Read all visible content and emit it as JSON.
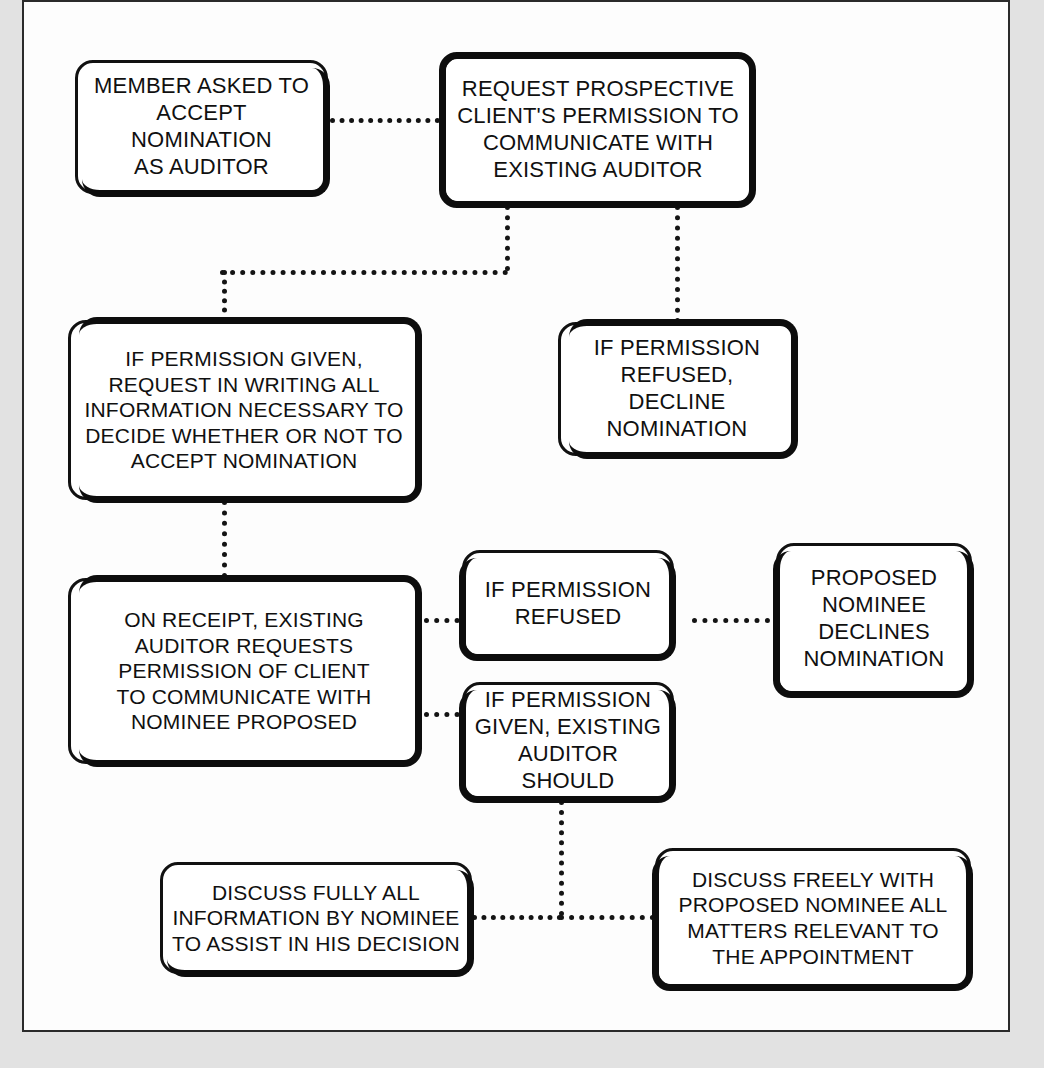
{
  "diagram": {
    "accent_color": "#111111",
    "page_background": "#fdfdfd",
    "connector_style": "dotted",
    "nodes": [
      {
        "id": "member-asked",
        "label": "MEMBER ASKED TO\nACCEPT NOMINATION\nAS AUDITOR"
      },
      {
        "id": "request-permission",
        "label": "REQUEST PROSPECTIVE\nCLIENT'S PERMISSION TO\nCOMMUNICATE WITH\nEXISTING AUDITOR"
      },
      {
        "id": "permission-given-request-writing",
        "label": "IF PERMISSION GIVEN,\nREQUEST IN WRITING  ALL\nINFORMATION NECESSARY TO\nDECIDE WHETHER OR NOT TO\nACCEPT NOMINATION"
      },
      {
        "id": "permission-refused-decline",
        "label": "IF PERMISSION\nREFUSED, DECLINE\nNOMINATION"
      },
      {
        "id": "on-receipt-existing-auditor",
        "label": "ON RECEIPT, EXISTING\nAUDITOR REQUESTS\nPERMISSION OF CLIENT\nTO COMMUNICATE WITH\nNOMINEE PROPOSED"
      },
      {
        "id": "permission-refused",
        "label": "IF PERMISSION\nREFUSED"
      },
      {
        "id": "proposed-nominee-declines",
        "label": "PROPOSED\nNOMINEE\nDECLINES\nNOMINATION"
      },
      {
        "id": "permission-given-existing-auditor",
        "label": "IF PERMISSION\nGIVEN, EXISTING\nAUDITOR SHOULD"
      },
      {
        "id": "discuss-fully-all",
        "label": "DISCUSS FULLY ALL\nINFORMATION BY NOMINEE\nTO ASSIST IN HIS DECISION"
      },
      {
        "id": "discuss-freely-with",
        "label": "DISCUSS FREELY WITH\nPROPOSED NOMINEE ALL\nMATTERS RELEVANT TO\nTHE APPOINTMENT"
      }
    ],
    "edges": [
      {
        "from": "member-asked",
        "to": "request-permission"
      },
      {
        "from": "request-permission",
        "to": "permission-given-request-writing"
      },
      {
        "from": "request-permission",
        "to": "permission-refused-decline"
      },
      {
        "from": "permission-given-request-writing",
        "to": "on-receipt-existing-auditor"
      },
      {
        "from": "on-receipt-existing-auditor",
        "to": "permission-refused"
      },
      {
        "from": "permission-refused",
        "to": "proposed-nominee-declines"
      },
      {
        "from": "on-receipt-existing-auditor",
        "to": "permission-given-existing-auditor"
      },
      {
        "from": "permission-given-existing-auditor",
        "to": "discuss-fully-all"
      },
      {
        "from": "permission-given-existing-auditor",
        "to": "discuss-freely-with"
      }
    ]
  }
}
